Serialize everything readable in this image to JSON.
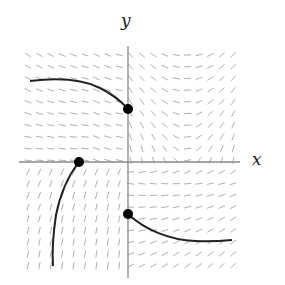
{
  "diagram": {
    "type": "slope_field",
    "axis_labels": {
      "x": "x",
      "y": "y"
    },
    "colors": {
      "axes": "#888888",
      "segments": "#b0b0b0",
      "curves": "#222222",
      "points": "#000000"
    },
    "grid": {
      "cols": 19,
      "rows": 19,
      "x0": 28,
      "y0": 55,
      "dx": 11.4,
      "dy": 11.7
    },
    "origin_px": {
      "x": 128,
      "y": 162
    },
    "points_px": [
      {
        "x": 128,
        "y": 109
      },
      {
        "x": 79,
        "y": 162
      },
      {
        "x": 128,
        "y": 214
      }
    ],
    "curves": [
      {
        "name": "upper-left-solution",
        "path": "M30,81 C55,78 80,78 100,88 C112,94 121,101 128,109"
      },
      {
        "name": "lower-left-solution",
        "path": "M79,162 C68,176 60,195 56,215 C53,235 52,252 53,266"
      },
      {
        "name": "lower-right-solution",
        "path": "M128,214 C145,230 170,240 195,241 C210,242 222,241 232,240"
      }
    ]
  }
}
